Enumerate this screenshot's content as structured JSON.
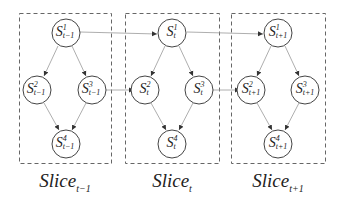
{
  "diagram": {
    "colors": {
      "stroke": "#555555",
      "edge": "#888888",
      "text": "#222222"
    },
    "slices": [
      {
        "label_main": "Slice",
        "label_sub": "t−1",
        "nodes": [
          {
            "base": "S",
            "sup": "1",
            "sub": "t−1"
          },
          {
            "base": "S",
            "sup": "2",
            "sub": "t−1"
          },
          {
            "base": "S",
            "sup": "3",
            "sub": "t−1"
          },
          {
            "base": "S",
            "sup": "4",
            "sub": "t−1"
          }
        ]
      },
      {
        "label_main": "Slice",
        "label_sub": "t",
        "nodes": [
          {
            "base": "S",
            "sup": "1",
            "sub": "t"
          },
          {
            "base": "S",
            "sup": "2",
            "sub": "t"
          },
          {
            "base": "S",
            "sup": "3",
            "sub": "t"
          },
          {
            "base": "S",
            "sup": "4",
            "sub": "t"
          }
        ]
      },
      {
        "label_main": "Slice",
        "label_sub": "t+1",
        "nodes": [
          {
            "base": "S",
            "sup": "1",
            "sub": "t+1"
          },
          {
            "base": "S",
            "sup": "2",
            "sub": "t+1"
          },
          {
            "base": "S",
            "sup": "3",
            "sub": "t+1"
          },
          {
            "base": "S",
            "sup": "4",
            "sub": "t+1"
          }
        ]
      }
    ],
    "intra_edges": [
      [
        "1",
        "2"
      ],
      [
        "1",
        "3"
      ],
      [
        "2",
        "4"
      ],
      [
        "3",
        "4"
      ]
    ],
    "inter_edges": [
      [
        "S1(t-1)",
        "S1(t)"
      ],
      [
        "S3(t-1)",
        "S2(t)"
      ],
      [
        "S1(t)",
        "S1(t+1)"
      ],
      [
        "S3(t)",
        "S2(t+1)"
      ]
    ]
  }
}
